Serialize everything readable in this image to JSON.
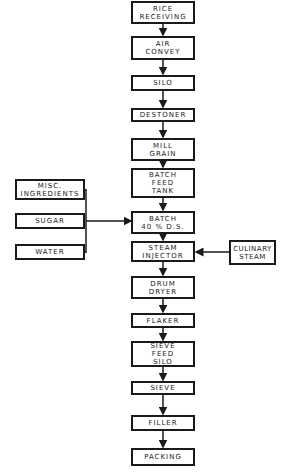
{
  "diagram": {
    "type": "process-flowchart",
    "main_flow": [
      {
        "id": "rice-receiving",
        "label": "RICE\nRECEIVING"
      },
      {
        "id": "air-convey",
        "label": "AIR\nCONVEY"
      },
      {
        "id": "silo",
        "label": "SILO"
      },
      {
        "id": "destoner",
        "label": "DESTONER"
      },
      {
        "id": "mill-grain",
        "label": "MILL\nGRAIN"
      },
      {
        "id": "batch-feed-tank",
        "label": "BATCH\nFEED\nTANK"
      },
      {
        "id": "batch",
        "label": "BATCH\n40 % D.S."
      },
      {
        "id": "steam-injector",
        "label": "STEAM\nINJECTOR"
      },
      {
        "id": "drum-dryer",
        "label": "DRUM\nDRYER"
      },
      {
        "id": "flaker",
        "label": "FLAKER"
      },
      {
        "id": "sieve-feed-silo",
        "label": "SIEVE\nFEED\nSILO"
      },
      {
        "id": "sieve",
        "label": "SIEVE"
      },
      {
        "id": "filler",
        "label": "FILLER"
      },
      {
        "id": "packing",
        "label": "PACKING"
      }
    ],
    "inputs": [
      {
        "id": "misc-ingredients",
        "label": "MISC.\nINGREDIENTS",
        "feeds": "batch"
      },
      {
        "id": "sugar",
        "label": "SUGAR",
        "feeds": "batch"
      },
      {
        "id": "water",
        "label": "WATER",
        "feeds": "batch"
      },
      {
        "id": "culinary-steam",
        "label": "CULINARY\nSTEAM",
        "feeds": "steam-injector"
      }
    ]
  }
}
